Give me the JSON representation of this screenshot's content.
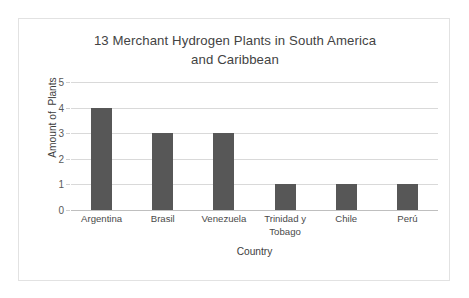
{
  "chart_data": {
    "type": "bar",
    "title": "13 Merchant Hydrogen Plants in South America\nand Caribbean",
    "xlabel": "Country",
    "ylabel": "Amount of  Plants",
    "categories": [
      "Argentina",
      "Brasil",
      "Venezuela",
      "Trinidad y\nTobago",
      "Chile",
      "Perú"
    ],
    "values": [
      4,
      3,
      3,
      1,
      1,
      1
    ],
    "ylim": [
      0,
      5
    ],
    "yticks": [
      "0",
      "1",
      "2",
      "3",
      "4",
      "5"
    ],
    "ytick_values": [
      0,
      1,
      2,
      3,
      4,
      5
    ],
    "grid": true,
    "legend": false,
    "legend_position": "none",
    "bar_color": "#575757",
    "gridline_color": "#d9d9d9",
    "title_color": "#434343",
    "frame_color": "#e2e2e2",
    "background_color": "#ffffff"
  }
}
